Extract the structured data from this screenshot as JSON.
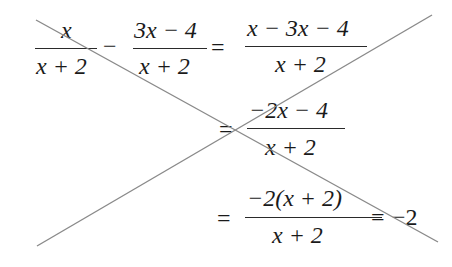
{
  "equation": {
    "row1": {
      "frac1": {
        "num": "x",
        "den": "x + 2"
      },
      "op1": "−",
      "frac2": {
        "num": "3x − 4",
        "den": "x + 2"
      },
      "eq": "=",
      "frac3": {
        "num": "x − 3x − 4",
        "den": "x + 2"
      }
    },
    "row2": {
      "eq": "=",
      "frac": {
        "num": "−2x − 4",
        "den": "x + 2"
      }
    },
    "row3": {
      "eq": "=",
      "frac": {
        "num": "−2(x + 2)",
        "den": "x + 2"
      },
      "eq2": "=",
      "result": "−2"
    }
  },
  "cross_lines": {
    "color": "#8a8a8a",
    "line1": {
      "x1": 36,
      "y1": 20,
      "x2": 438,
      "y2": 242
    },
    "line2": {
      "x1": 37,
      "y1": 246,
      "x2": 432,
      "y2": 15
    }
  }
}
